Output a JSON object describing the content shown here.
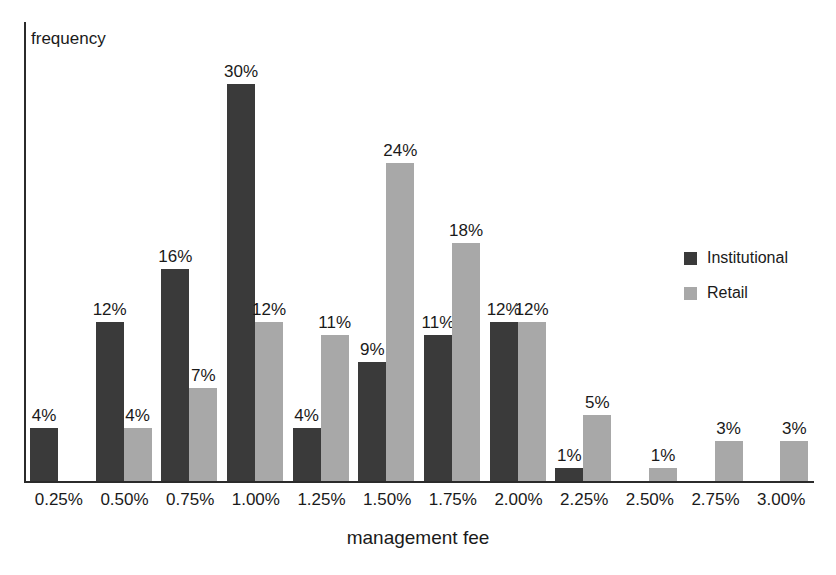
{
  "chart_data": {
    "type": "bar",
    "title": "",
    "subtitle": "",
    "xlabel": "management fee",
    "ylabel": "frequency",
    "grid": false,
    "legend_position": "right",
    "ylim": [
      0,
      30
    ],
    "categories": [
      "0.25%",
      "0.50%",
      "0.75%",
      "1.00%",
      "1.25%",
      "1.50%",
      "1.75%",
      "2.00%",
      "2.25%",
      "2.50%",
      "2.75%",
      "3.00%"
    ],
    "series": [
      {
        "name": "Institutional",
        "color": "#3a3a3a",
        "values": [
          4,
          12,
          16,
          30,
          4,
          9,
          11,
          12,
          1,
          null,
          null,
          null
        ],
        "labels": [
          "4%",
          "12%",
          "16%",
          "30%",
          "4%",
          "9%",
          "11%",
          "12%",
          "1%",
          "",
          "",
          ""
        ]
      },
      {
        "name": "Retail",
        "color": "#a8a8a8",
        "values": [
          null,
          4,
          7,
          12,
          11,
          24,
          18,
          12,
          5,
          1,
          3,
          3
        ],
        "labels": [
          "",
          "4%",
          "7%",
          "12%",
          "11%",
          "24%",
          "18%",
          "12%",
          "5%",
          "1%",
          "3%",
          "3%"
        ]
      }
    ]
  },
  "axes": {
    "y_axis_title": "frequency",
    "x_axis_title": "management fee"
  },
  "legend": {
    "items": [
      {
        "label": "Institutional",
        "color": "#3a3a3a"
      },
      {
        "label": "Retail",
        "color": "#a8a8a8"
      }
    ]
  },
  "colors": {
    "institutional": "#3a3a3a",
    "retail": "#a8a8a8",
    "axis": "#2b2b2b",
    "text": "#1a1a1a",
    "background": "#ffffff"
  }
}
